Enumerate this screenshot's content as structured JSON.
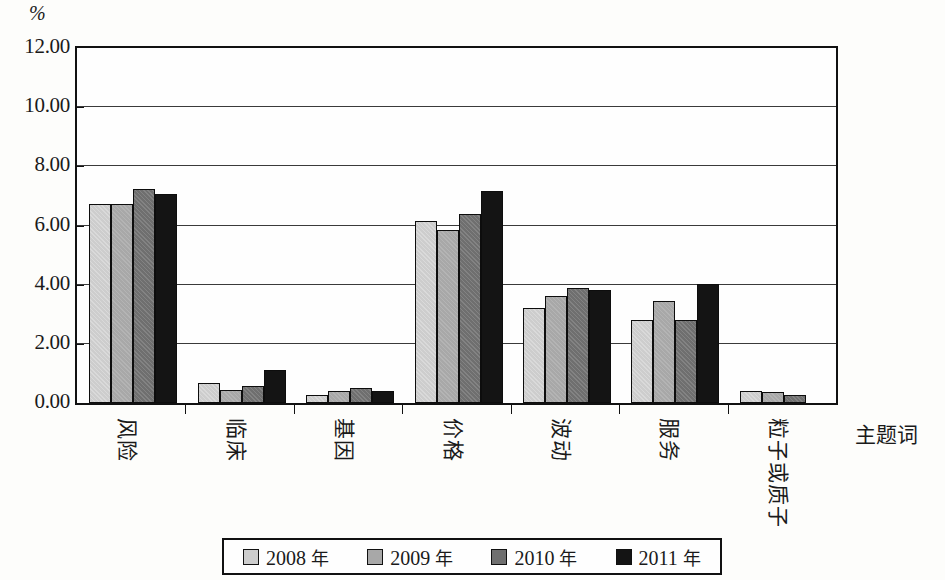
{
  "chart_data": {
    "type": "bar",
    "title": "",
    "subtitle": "",
    "xlabel": "主题词",
    "ylabel": "%",
    "ylim": [
      0,
      12
    ],
    "ytick_labels": [
      "0.00",
      "2.00",
      "4.00",
      "6.00",
      "8.00",
      "10.00",
      "12.00"
    ],
    "ytick_values": [
      0,
      2,
      4,
      6,
      8,
      10,
      12
    ],
    "grid": true,
    "grid_axis": "y",
    "legend_position": "bottom",
    "categories": [
      "风险",
      "临床",
      "基因",
      "价格",
      "波动",
      "服务",
      "粒子或质子"
    ],
    "series": [
      {
        "name": "2008 年",
        "color": "#cdcdcd",
        "values": [
          6.72,
          0.68,
          0.28,
          6.15,
          3.2,
          2.8,
          0.42
        ]
      },
      {
        "name": "2009 年",
        "color": "#a8a8a8",
        "values": [
          6.72,
          0.45,
          0.42,
          5.85,
          3.62,
          3.45,
          0.38
        ]
      },
      {
        "name": "2010 年",
        "color": "#6f6f6f",
        "values": [
          7.25,
          0.58,
          0.5,
          6.38,
          3.88,
          2.8,
          0.28
        ]
      },
      {
        "name": "2011 年",
        "color": "#141414",
        "values": [
          7.05,
          1.1,
          0.4,
          7.18,
          3.82,
          4.02,
          0.0
        ]
      }
    ]
  },
  "legend": {
    "items": [
      {
        "label": "2008 年",
        "color": "#cdcdcd"
      },
      {
        "label": "2009 年",
        "color": "#a8a8a8"
      },
      {
        "label": "2010 年",
        "color": "#6f6f6f"
      },
      {
        "label": "2011 年",
        "color": "#141414"
      }
    ]
  }
}
